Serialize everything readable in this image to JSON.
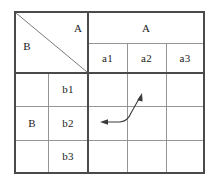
{
  "figure": {
    "type": "cross-tabulation-table-with-annotation",
    "corner": {
      "col_label": "A",
      "row_label": "B",
      "split": "diagonal"
    },
    "columns": {
      "group_label": "A",
      "headers": [
        "a1",
        "a2",
        "a3"
      ]
    },
    "rows": {
      "group_label": "B",
      "headers": [
        "b1",
        "b2",
        "b3"
      ]
    },
    "body_cells": [
      [
        "",
        "",
        ""
      ],
      [
        "",
        "",
        ""
      ],
      [
        "",
        "",
        ""
      ]
    ],
    "annotation": {
      "name": "double-headed-curved-arrow",
      "description": "curved line with arrowheads at both ends",
      "head_left_target": "b2 / a1 cell",
      "head_upper_right_target": "b1 / a2 cell"
    },
    "colors": {
      "outer_border": "#4a4a4a",
      "inner_rule": "#8a8a8a",
      "diagonal_rule": "#7a7a7a",
      "arrow": "#3a3a3a",
      "text": "#1a1a1a",
      "background": "#ffffff"
    },
    "geometry": {
      "left": 15,
      "right": 204,
      "top": 12,
      "bottom": 173,
      "col_x": [
        15,
        48,
        88,
        127,
        166,
        204
      ],
      "row_y": [
        12,
        43,
        73,
        106,
        140,
        173
      ]
    }
  }
}
